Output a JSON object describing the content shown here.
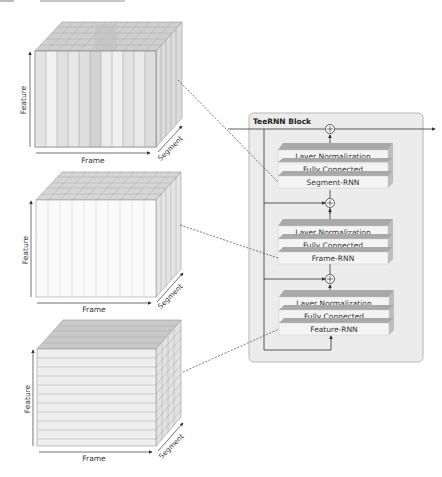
{
  "figure": {
    "type": "architecture-diagram",
    "cubes": [
      {
        "id": "segment-cube",
        "orientation": "vertical-slices",
        "axis_labels": {
          "vertical": "Feature",
          "horizontal": "Frame",
          "depth": "Segment"
        }
      },
      {
        "id": "frame-cube",
        "orientation": "vertical-slices-light",
        "axis_labels": {
          "vertical": "Feature",
          "horizontal": "Frame",
          "depth": "Segment"
        }
      },
      {
        "id": "feature-cube",
        "orientation": "horizontal-slices",
        "axis_labels": {
          "vertical": "Feature",
          "horizontal": "Frame",
          "depth": "Segment"
        }
      }
    ],
    "block": {
      "title": "TeeRNN Block",
      "stages": [
        {
          "name": "segment-stage",
          "layers": [
            "Layer Normalization",
            "Fully Connected",
            "Segment-RNN"
          ]
        },
        {
          "name": "frame-stage",
          "layers": [
            "Layer Normalization",
            "Fully Connected",
            "Frame-RNN"
          ]
        },
        {
          "name": "feature-stage",
          "layers": [
            "Layer Normalization",
            "Fully Connected",
            "Feature-RNN"
          ]
        }
      ],
      "add_symbol": "⊕"
    },
    "colors": {
      "block_bg": "#ececec",
      "block_border": "#b5b5b5",
      "layer_face": "#f4f4f4",
      "layer_top": "#a9a9a9",
      "line": "#333333",
      "dashed": "#555555"
    }
  }
}
